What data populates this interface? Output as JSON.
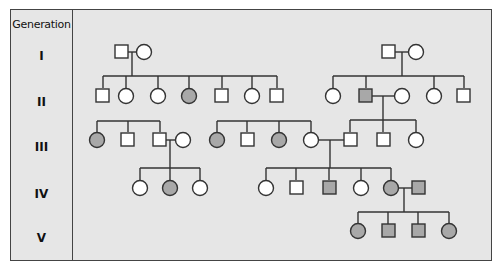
{
  "legend": {
    "header": "Generation",
    "generations": [
      "I",
      "II",
      "III",
      "IV",
      "V"
    ]
  },
  "colors": {
    "affected": "#a8a8a8",
    "unaffected": "#ffffff",
    "line": "#333333",
    "panel": "#e6e6e6"
  },
  "pedigree": {
    "generation_I": [
      {
        "sex": "male",
        "affected": false
      },
      {
        "sex": "female",
        "affected": false
      },
      {
        "sex": "male",
        "affected": false
      },
      {
        "sex": "female",
        "affected": false
      }
    ],
    "generation_II": [
      {
        "sex": "male",
        "affected": false
      },
      {
        "sex": "female",
        "affected": false
      },
      {
        "sex": "female",
        "affected": false
      },
      {
        "sex": "female",
        "affected": true
      },
      {
        "sex": "male",
        "affected": false
      },
      {
        "sex": "female",
        "affected": false
      },
      {
        "sex": "male",
        "affected": false
      },
      {
        "sex": "female",
        "affected": false
      },
      {
        "sex": "male",
        "affected": true
      },
      {
        "sex": "female",
        "affected": false,
        "note": "spouse"
      },
      {
        "sex": "female",
        "affected": false
      },
      {
        "sex": "male",
        "affected": false
      }
    ],
    "generation_III": [
      {
        "sex": "female",
        "affected": true
      },
      {
        "sex": "male",
        "affected": false
      },
      {
        "sex": "male",
        "affected": false
      },
      {
        "sex": "female",
        "affected": false,
        "note": "spouse"
      },
      {
        "sex": "female",
        "affected": true
      },
      {
        "sex": "male",
        "affected": false
      },
      {
        "sex": "female",
        "affected": true
      },
      {
        "sex": "female",
        "affected": false
      },
      {
        "sex": "male",
        "affected": false
      },
      {
        "sex": "male",
        "affected": false
      },
      {
        "sex": "female",
        "affected": false
      }
    ],
    "generation_IV": [
      {
        "sex": "female",
        "affected": false
      },
      {
        "sex": "female",
        "affected": true
      },
      {
        "sex": "female",
        "affected": false
      },
      {
        "sex": "female",
        "affected": false
      },
      {
        "sex": "male",
        "affected": false
      },
      {
        "sex": "male",
        "affected": true
      },
      {
        "sex": "female",
        "affected": false
      },
      {
        "sex": "female",
        "affected": true
      },
      {
        "sex": "male",
        "affected": true,
        "note": "spouse"
      }
    ],
    "generation_V": [
      {
        "sex": "female",
        "affected": true
      },
      {
        "sex": "male",
        "affected": true
      },
      {
        "sex": "male",
        "affected": true
      },
      {
        "sex": "female",
        "affected": true
      }
    ]
  }
}
